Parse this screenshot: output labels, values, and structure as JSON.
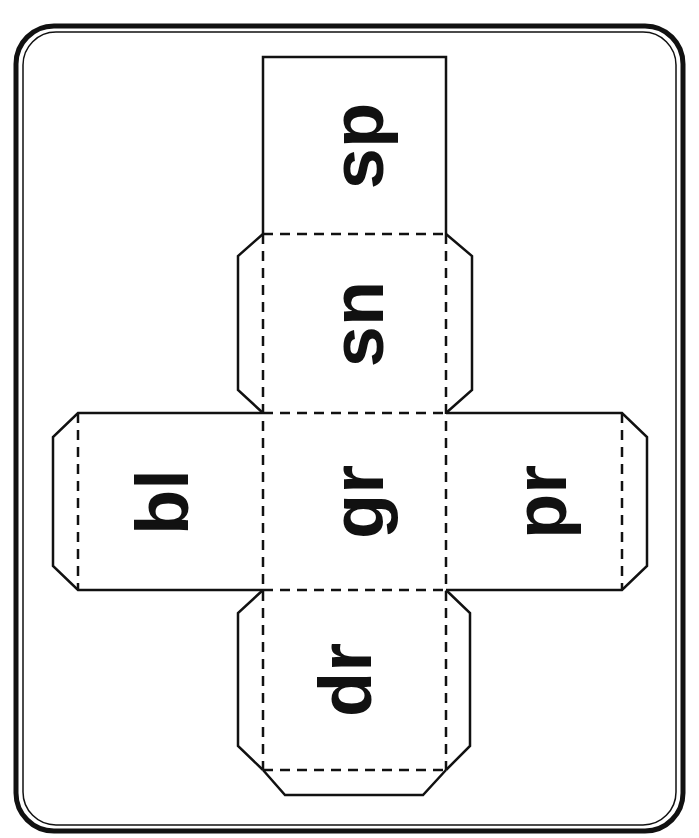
{
  "worksheet": {
    "type": "cube-net",
    "colors": {
      "line": "#111111",
      "background": "#ffffff"
    },
    "faces": [
      {
        "id": "top",
        "label": "sp"
      },
      {
        "id": "upper",
        "label": "sn"
      },
      {
        "id": "left",
        "label": "bl"
      },
      {
        "id": "center",
        "label": "gr"
      },
      {
        "id": "right",
        "label": "pr"
      },
      {
        "id": "bottom",
        "label": "dr"
      }
    ]
  }
}
